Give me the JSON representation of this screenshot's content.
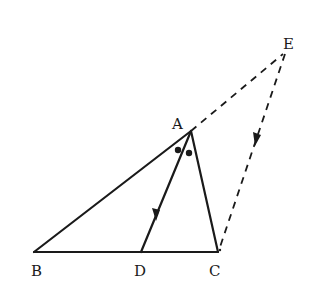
{
  "diagram": {
    "type": "geometry",
    "colors": {
      "stroke": "#1a1a1a",
      "background": "#ffffff"
    },
    "points": {
      "A": {
        "label": "A",
        "x": 191,
        "y": 131
      },
      "B": {
        "label": "B",
        "x": 34,
        "y": 252
      },
      "C": {
        "label": "C",
        "x": 218,
        "y": 252
      },
      "D": {
        "label": "D",
        "x": 141,
        "y": 252
      },
      "E": {
        "label": "E",
        "x": 285,
        "y": 52
      }
    },
    "segments": [
      {
        "from": "A",
        "to": "B",
        "style": "solid"
      },
      {
        "from": "B",
        "to": "C",
        "style": "solid"
      },
      {
        "from": "A",
        "to": "C",
        "style": "solid"
      },
      {
        "from": "A",
        "to": "D",
        "style": "solid",
        "arrow": "toward D"
      },
      {
        "from": "A",
        "to": "E",
        "style": "dashed"
      },
      {
        "from": "E",
        "to": "C",
        "style": "dashed",
        "arrow": "toward C"
      }
    ],
    "angle_marks": {
      "vertex": "A",
      "marker": "dot",
      "count": 2,
      "meaning": "equal angles BAD and DAC"
    }
  }
}
